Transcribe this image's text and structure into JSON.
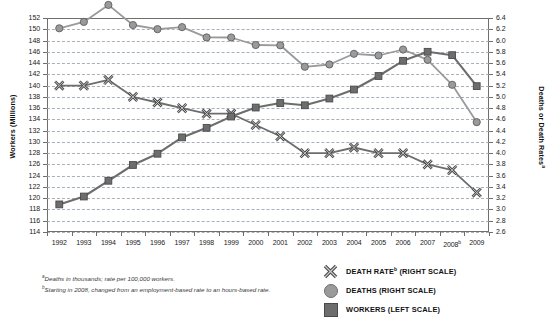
{
  "chart_data": {
    "type": "line",
    "title": "",
    "xlabel": "",
    "ylabel": "Workers (Millions)",
    "ylabel_right": "Deaths or Death Rates",
    "ylabel_right_sup": "a",
    "categories": [
      "1992",
      "1993",
      "1994",
      "1995",
      "1996",
      "1997",
      "1998",
      "1999",
      "2000",
      "2001",
      "2002",
      "2003",
      "2004",
      "2005",
      "2006",
      "2007",
      "2008",
      "2009"
    ],
    "category_sups": [
      "",
      "",
      "",
      "",
      "",
      "",
      "",
      "",
      "",
      "",
      "",
      "",
      "",
      "",
      "",
      "",
      "b",
      ""
    ],
    "ylim": [
      114,
      152
    ],
    "ytick_step": 2,
    "yticks": [
      152,
      150,
      148,
      146,
      144,
      142,
      140,
      138,
      136,
      134,
      132,
      130,
      128,
      126,
      124,
      122,
      120,
      118,
      116,
      114
    ],
    "ylim_right": [
      2.6,
      6.4
    ],
    "ytick_right_step": 0.2,
    "yticks_right": [
      "6.4",
      "6.2",
      "6.0",
      "5.8",
      "5.6",
      "5.4",
      "5.2",
      "5.0",
      "4.8",
      "4.6",
      "4.4",
      "4.2",
      "4.0",
      "3.8",
      "3.6",
      "3.4",
      "3.2",
      "3.0",
      "2.8",
      "2.6"
    ],
    "grid": true,
    "legend_position": "bottom-right",
    "series": [
      {
        "name": "DEATH RATE",
        "name_sup": "b",
        "legend_label": "DEATH RATE (RIGHT SCALE)",
        "marker": "x",
        "axis": "right",
        "color": "#6d6d6d",
        "values": [
          5.2,
          5.2,
          5.3,
          5.0,
          4.9,
          4.8,
          4.7,
          4.7,
          4.5,
          4.3,
          4.0,
          4.0,
          4.1,
          4.0,
          4.0,
          3.8,
          3.7,
          3.3
        ]
      },
      {
        "name": "DEATHS",
        "legend_label": "DEATHS (RIGHT SCALE)",
        "marker": "circle",
        "axis": "right",
        "color": "#9a9a9a",
        "values": [
          6.217,
          6.331,
          6.632,
          6.275,
          6.202,
          6.238,
          6.055,
          6.054,
          5.92,
          5.915,
          5.534,
          5.575,
          5.764,
          5.734,
          5.84,
          5.657,
          5.214,
          4.551
        ]
      },
      {
        "name": "WORKERS",
        "legend_label": "WORKERS (LEFT SCALE)",
        "marker": "square",
        "axis": "left",
        "color": "#6d6d6d",
        "values": [
          118.9,
          120.3,
          123.1,
          125.9,
          127.9,
          130.8,
          132.5,
          134.5,
          136.1,
          136.9,
          136.5,
          137.7,
          139.3,
          141.7,
          144.4,
          146.0,
          145.4,
          139.9
        ]
      }
    ],
    "footnotes": [
      {
        "sup": "a",
        "text": "Deaths in thousands; rate per 100,000 workers."
      },
      {
        "sup": "b",
        "text": "Starting in 2008, changed from an employment-based rate to an hours-based rate."
      }
    ],
    "colors": {
      "grid": "#9aa4b0",
      "frame": "#6f6f6f",
      "workers": "#6d6d6d",
      "deaths": "#9a9a9a",
      "death_rate": "#6d6d6d",
      "text": "#1a1a1a"
    }
  }
}
